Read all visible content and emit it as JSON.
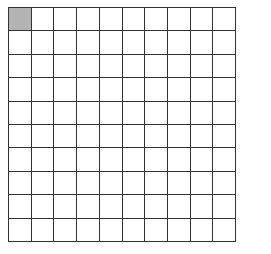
{
  "grid": {
    "rows": 10,
    "columns": 10,
    "total_cells": 100,
    "shaded_cells": [
      [
        0,
        0
      ]
    ],
    "shaded_count": 1,
    "shade_color": "#b3b3b3",
    "line_color": "#333333"
  }
}
